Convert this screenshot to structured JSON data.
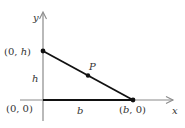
{
  "diagram": {
    "type": "coordinate-triangle",
    "axes": {
      "x_label": "x",
      "y_label": "y",
      "axis_color": "#8a8a8a"
    },
    "points": {
      "top": {
        "label": "(0, h)",
        "prefix": "(0, ",
        "var": "h",
        "suffix": ")"
      },
      "origin": {
        "label": "(0, 0)"
      },
      "base": {
        "label": "(b, 0)",
        "prefix": "(",
        "var": "b",
        "suffix": ", 0)"
      },
      "p": {
        "label": "P"
      }
    },
    "segment_labels": {
      "height": "h",
      "base": "b"
    },
    "line_color": "#111111"
  }
}
